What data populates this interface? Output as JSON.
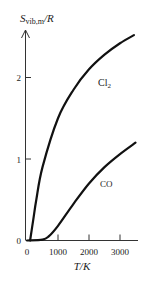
{
  "chart_data": {
    "type": "line",
    "title": "",
    "xlabel": "T/K",
    "ylabel": "S_vib,m/R",
    "ylabel_parts": {
      "main": "S",
      "sub": "vib,m",
      "tail": "/R"
    },
    "xlim": [
      0,
      3500
    ],
    "ylim": [
      0,
      2.6
    ],
    "x_ticks": [
      0,
      1000,
      2000,
      3000
    ],
    "x_tick_labels": [
      "0",
      "1000",
      "2000",
      "3000"
    ],
    "y_ticks": [
      0,
      1,
      2
    ],
    "y_tick_labels": [
      "0",
      "1",
      "2"
    ],
    "grid": false,
    "legend": "inline labels",
    "series": [
      {
        "name": "Cl2",
        "label_main": "Cl",
        "label_sub": "2",
        "x": [
          100,
          200,
          300,
          500,
          1000,
          1500,
          2000,
          2500,
          3000,
          3450
        ],
        "values": [
          0.0,
          0.25,
          0.5,
          0.9,
          1.5,
          1.85,
          2.1,
          2.28,
          2.42,
          2.52
        ]
      },
      {
        "name": "CO",
        "label_main": "CO",
        "label_sub": "",
        "x": [
          0,
          500,
          700,
          1000,
          1500,
          2000,
          2500,
          3000,
          3500
        ],
        "values": [
          0.0,
          0.01,
          0.05,
          0.18,
          0.45,
          0.7,
          0.9,
          1.06,
          1.2
        ]
      }
    ]
  }
}
